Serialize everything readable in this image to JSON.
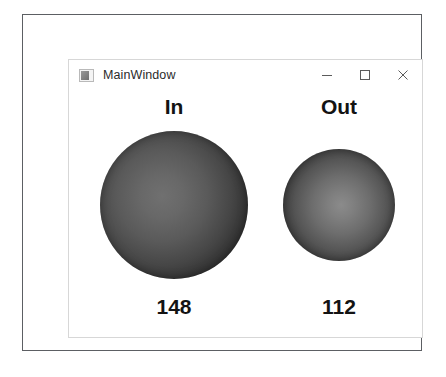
{
  "window": {
    "title": "MainWindow",
    "icon": "app-icon",
    "controls": {
      "minimize": "minimize-icon",
      "maximize": "maximize-icon",
      "close": "close-icon"
    }
  },
  "gauges": [
    {
      "id": "in",
      "label": "In",
      "value": "148",
      "diameter_px": 148,
      "highlight_color": "#707070",
      "edge_color": "#141414"
    },
    {
      "id": "out",
      "label": "Out",
      "value": "112",
      "diameter_px": 112,
      "highlight_color": "#8b8b8b",
      "edge_color": "#171717"
    }
  ]
}
